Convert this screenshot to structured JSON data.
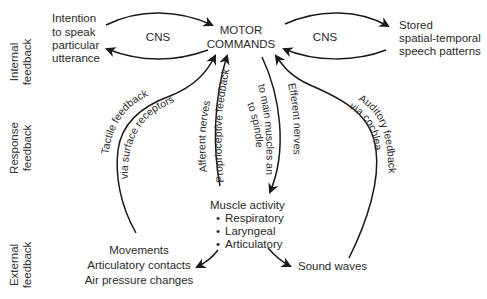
{
  "side_labels": {
    "internal": [
      "Internal",
      "feedback"
    ],
    "response": [
      "Response",
      "feedback"
    ],
    "external": [
      "External",
      "feedback"
    ]
  },
  "nodes": {
    "intention": [
      "Intention",
      "to speak",
      "particular",
      "utterance"
    ],
    "motor_commands": [
      "MOTOR",
      "COMMANDS"
    ],
    "stored_patterns": [
      "Stored",
      "spatial-temporal",
      "speech patterns"
    ],
    "muscle_activity": {
      "title": "Muscle activity",
      "items": [
        "Respiratory",
        "Laryngeal",
        "Articulatory"
      ]
    },
    "movements": [
      "Movements",
      "Articulatory contacts",
      "Air pressure changes"
    ],
    "sound_waves": "Sound waves"
  },
  "edge_labels": {
    "cns_left": "CNS",
    "cns_right": "CNS",
    "tactile_1": "Tactile feedback",
    "tactile_2": "via surface receptors",
    "afferent": "Afferent nerves",
    "proprioceptive": "Proprioceptive feedback",
    "to_main_1": "to main muscles and",
    "to_main_2": "to spindles",
    "efferent": "Efferent nerves",
    "auditory_1": "Auditory feedback",
    "auditory_2": "via cochlea"
  },
  "colors": {
    "stroke": "#1a1a1a",
    "text": "#2a2a2a",
    "background": "#ffffff"
  }
}
